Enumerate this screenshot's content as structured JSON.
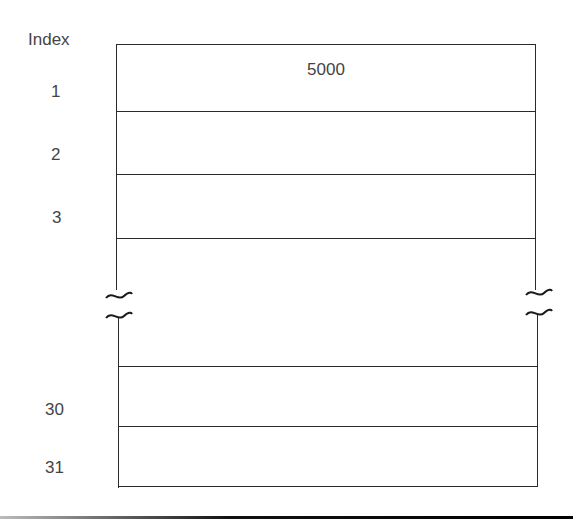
{
  "diagram": {
    "index_header": "Index",
    "rows": [
      {
        "index": "1",
        "value": "5000"
      },
      {
        "index": "2",
        "value": ""
      },
      {
        "index": "3",
        "value": ""
      },
      {
        "index": "30",
        "value": ""
      },
      {
        "index": "31",
        "value": ""
      }
    ],
    "break_symbol": "~",
    "line_color": "#2a2a2a",
    "text_color": "#444444"
  }
}
